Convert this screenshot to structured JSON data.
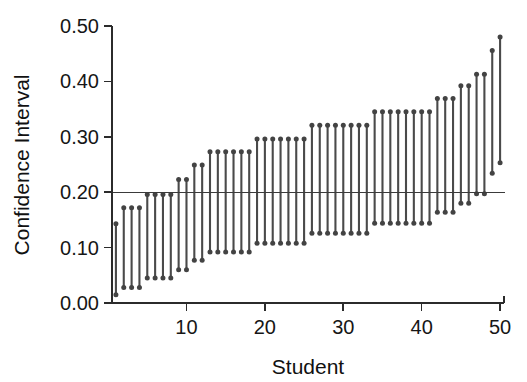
{
  "chart_data": {
    "type": "line",
    "title": "",
    "subtitle": "",
    "xlabel": "Student",
    "ylabel": "Confidence Interval",
    "xlim": [
      0.5,
      50.5
    ],
    "ylim": [
      0.0,
      0.5
    ],
    "grid": false,
    "legend": false,
    "legend_position": "none",
    "x_ticks": [
      10,
      20,
      30,
      40,
      50
    ],
    "x_tick_labels": [
      "10",
      "20",
      "30",
      "40",
      "50"
    ],
    "y_ticks": [
      0.0,
      0.1,
      0.2,
      0.3,
      0.4,
      0.5
    ],
    "y_tick_labels": [
      "0.00",
      "0.10",
      "0.20",
      "0.30",
      "0.40",
      "0.50"
    ],
    "reference_line": {
      "axis": "y",
      "value": 0.2,
      "label": "0.20"
    },
    "marker": "circle",
    "series_description": "Vertical confidence interval segments (lower bound to upper bound) per student, sorted by increasing bound.",
    "x": [
      1,
      2,
      3,
      4,
      5,
      6,
      7,
      8,
      9,
      10,
      11,
      12,
      13,
      14,
      15,
      16,
      17,
      18,
      19,
      20,
      21,
      22,
      23,
      24,
      25,
      26,
      27,
      28,
      29,
      30,
      31,
      32,
      33,
      34,
      35,
      36,
      37,
      38,
      39,
      40,
      41,
      42,
      43,
      44,
      45,
      46,
      47,
      48,
      49,
      50
    ],
    "series": [
      {
        "name": "Lower bound",
        "values": [
          0.015,
          0.028,
          0.028,
          0.028,
          0.045,
          0.045,
          0.045,
          0.045,
          0.06,
          0.06,
          0.077,
          0.077,
          0.092,
          0.092,
          0.092,
          0.092,
          0.092,
          0.092,
          0.108,
          0.108,
          0.108,
          0.108,
          0.108,
          0.108,
          0.108,
          0.126,
          0.126,
          0.126,
          0.126,
          0.126,
          0.126,
          0.126,
          0.126,
          0.144,
          0.144,
          0.144,
          0.144,
          0.144,
          0.144,
          0.144,
          0.144,
          0.164,
          0.164,
          0.164,
          0.18,
          0.18,
          0.197,
          0.197,
          0.234,
          0.253
        ]
      },
      {
        "name": "Upper bound",
        "values": [
          0.143,
          0.172,
          0.172,
          0.172,
          0.196,
          0.196,
          0.196,
          0.196,
          0.223,
          0.223,
          0.249,
          0.249,
          0.273,
          0.273,
          0.273,
          0.273,
          0.273,
          0.273,
          0.296,
          0.296,
          0.296,
          0.296,
          0.296,
          0.296,
          0.296,
          0.321,
          0.321,
          0.321,
          0.321,
          0.321,
          0.321,
          0.321,
          0.321,
          0.345,
          0.345,
          0.345,
          0.345,
          0.345,
          0.345,
          0.345,
          0.345,
          0.369,
          0.369,
          0.369,
          0.392,
          0.392,
          0.413,
          0.413,
          0.456,
          0.48
        ]
      }
    ],
    "colors": {
      "marker": "#434343",
      "stem": "#4a4a4a",
      "axis": "#2b2b2b",
      "reference_line": "#3a3a3a",
      "background": "#ffffff"
    }
  }
}
